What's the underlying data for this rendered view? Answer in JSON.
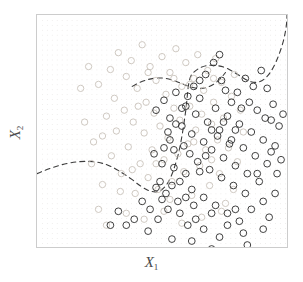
{
  "figure": {
    "xlabel": "X",
    "xlabel_sub": "1",
    "ylabel": "X",
    "ylabel_sub": "2"
  },
  "colors": {
    "class_orange": "#c9c2bb",
    "class_blue": "#2a2a2a",
    "boundary": "#3b3b3b",
    "lattice_dot": "#e3e0de",
    "frame": "#cccccc",
    "background": "#ffffff"
  },
  "chart_data": {
    "type": "scatter",
    "title": "",
    "xlabel": "X1",
    "ylabel": "X2",
    "xlim": [
      0,
      252
    ],
    "ylim": [
      0,
      234
    ],
    "grid": true,
    "grid_spacing": 5,
    "legend": "none",
    "annotations": [
      "dashed Bayes decision boundary"
    ],
    "series": [
      {
        "name": "class-orange",
        "marker": "open-circle",
        "color": "#c9c2bb",
        "radius": 3.2,
        "points": [
          [
            57,
            128
          ],
          [
            62,
            70
          ],
          [
            66,
            171
          ],
          [
            70,
            102
          ],
          [
            74,
            55
          ],
          [
            75,
            142
          ],
          [
            78,
            84
          ],
          [
            80,
            117
          ],
          [
            82,
            38
          ],
          [
            85,
            160
          ],
          [
            88,
            96
          ],
          [
            90,
            62
          ],
          [
            92,
            133
          ],
          [
            95,
            46
          ],
          [
            97,
            108
          ],
          [
            99,
            180
          ],
          [
            101,
            74
          ],
          [
            104,
            150
          ],
          [
            106,
            30
          ],
          [
            108,
            119
          ],
          [
            110,
            88
          ],
          [
            112,
            164
          ],
          [
            114,
            52
          ],
          [
            116,
            136
          ],
          [
            118,
            99
          ],
          [
            120,
            66
          ],
          [
            122,
            176
          ],
          [
            124,
            112
          ],
          [
            126,
            42
          ],
          [
            128,
            146
          ],
          [
            130,
            80
          ],
          [
            132,
            124
          ],
          [
            134,
            58
          ],
          [
            136,
            168
          ],
          [
            138,
            94
          ],
          [
            140,
            34
          ],
          [
            142,
            140
          ],
          [
            144,
            106
          ],
          [
            146,
            72
          ],
          [
            148,
            158
          ],
          [
            150,
            48
          ],
          [
            152,
            130
          ],
          [
            154,
            92
          ],
          [
            156,
            182
          ],
          [
            158,
            64
          ],
          [
            160,
            116
          ],
          [
            162,
            40
          ],
          [
            164,
            152
          ],
          [
            166,
            100
          ],
          [
            168,
            76
          ],
          [
            170,
            136
          ],
          [
            172,
            56
          ],
          [
            174,
            172
          ],
          [
            176,
            110
          ],
          [
            178,
            88
          ],
          [
            180,
            44
          ],
          [
            182,
            126
          ],
          [
            184,
            160
          ],
          [
            186,
            68
          ],
          [
            188,
            104
          ],
          [
            190,
            190
          ],
          [
            193,
            134
          ],
          [
            196,
            82
          ],
          [
            199,
            60
          ],
          [
            202,
            148
          ],
          [
            205,
            96
          ],
          [
            208,
            118
          ],
          [
            62,
            196
          ],
          [
            70,
            212
          ],
          [
            55,
            150
          ],
          [
            48,
            108
          ],
          [
            44,
            74
          ],
          [
            90,
            200
          ],
          [
            108,
            206
          ],
          [
            128,
            198
          ],
          [
            146,
            210
          ],
          [
            166,
            204
          ],
          [
            186,
            198
          ],
          [
            52,
            52
          ],
          [
            96,
            156
          ],
          [
            112,
            58
          ],
          [
            134,
            186
          ],
          [
            154,
            70
          ],
          [
            176,
            146
          ],
          [
            198,
            176
          ],
          [
            66,
            122
          ],
          [
            84,
            178
          ],
          [
            102,
            92
          ],
          [
            120,
            150
          ],
          [
            138,
            64
          ],
          [
            158,
            128
          ],
          [
            178,
            64
          ]
        ]
      },
      {
        "name": "class-blue",
        "marker": "open-circle",
        "color": "#2a2a2a",
        "radius": 3.4,
        "points": [
          [
            120,
            96
          ],
          [
            128,
            86
          ],
          [
            134,
            104
          ],
          [
            140,
            78
          ],
          [
            146,
            112
          ],
          [
            150,
            92
          ],
          [
            156,
            120
          ],
          [
            160,
            100
          ],
          [
            164,
            84
          ],
          [
            168,
            128
          ],
          [
            172,
            108
          ],
          [
            176,
            136
          ],
          [
            180,
            94
          ],
          [
            184,
            116
          ],
          [
            188,
            144
          ],
          [
            192,
            102
          ],
          [
            196,
            126
          ],
          [
            200,
            152
          ],
          [
            204,
            110
          ],
          [
            208,
            134
          ],
          [
            212,
            160
          ],
          [
            216,
            118
          ],
          [
            220,
            142
          ],
          [
            224,
            168
          ],
          [
            228,
            126
          ],
          [
            232,
            150
          ],
          [
            236,
            106
          ],
          [
            240,
            132
          ],
          [
            150,
            160
          ],
          [
            156,
            176
          ],
          [
            162,
            148
          ],
          [
            168,
            184
          ],
          [
            174,
            156
          ],
          [
            180,
            192
          ],
          [
            186,
            164
          ],
          [
            192,
            200
          ],
          [
            198,
            172
          ],
          [
            204,
            208
          ],
          [
            210,
            180
          ],
          [
            216,
            196
          ],
          [
            222,
            160
          ],
          [
            228,
            188
          ],
          [
            144,
            200
          ],
          [
            152,
            212
          ],
          [
            160,
            206
          ],
          [
            168,
            216
          ],
          [
            176,
            200
          ],
          [
            184,
            224
          ],
          [
            192,
            212
          ],
          [
            200,
            196
          ],
          [
            208,
            220
          ],
          [
            132,
            118
          ],
          [
            138,
            136
          ],
          [
            126,
            150
          ],
          [
            118,
            140
          ],
          [
            124,
            168
          ],
          [
            130,
            180
          ],
          [
            136,
            172
          ],
          [
            142,
            188
          ],
          [
            148,
            132
          ],
          [
            154,
            140
          ],
          [
            122,
            206
          ],
          [
            114,
            196
          ],
          [
            106,
            188
          ],
          [
            98,
            206
          ],
          [
            90,
            212
          ],
          [
            82,
            198
          ],
          [
            74,
            212
          ],
          [
            112,
            218
          ],
          [
            136,
            226
          ],
          [
            170,
            60
          ],
          [
            178,
            48
          ],
          [
            186,
            66
          ],
          [
            232,
            74
          ],
          [
            238,
            90
          ],
          [
            244,
            112
          ],
          [
            248,
            100
          ],
          [
            226,
            56
          ],
          [
            218,
            72
          ],
          [
            210,
            64
          ],
          [
            202,
            78
          ],
          [
            196,
            88
          ],
          [
            190,
            76
          ],
          [
            184,
            40
          ],
          [
            158,
            72
          ],
          [
            164,
            66
          ],
          [
            152,
            82
          ],
          [
            146,
            94
          ],
          [
            140,
            110
          ],
          [
            134,
            126
          ],
          [
            128,
            134
          ],
          [
            196,
            240
          ],
          [
            176,
            236
          ],
          [
            156,
            228
          ],
          [
            212,
            232
          ],
          [
            240,
            180
          ],
          [
            234,
            204
          ],
          [
            228,
            216
          ],
          [
            246,
            146
          ],
          [
            242,
            160
          ],
          [
            236,
            138
          ],
          [
            230,
            104
          ],
          [
            222,
            96
          ],
          [
            214,
            88
          ],
          [
            206,
            94
          ],
          [
            200,
            116
          ],
          [
            194,
            130
          ],
          [
            188,
            108
          ],
          [
            182,
            122
          ],
          [
            176,
            116
          ],
          [
            170,
            142
          ],
          [
            164,
            158
          ],
          [
            158,
            192
          ],
          [
            150,
            184
          ],
          [
            144,
            168
          ],
          [
            138,
            154
          ],
          [
            132,
            196
          ],
          [
            126,
            186
          ],
          [
            120,
            174
          ]
        ]
      }
    ],
    "boundary_paths": [
      "M 0 160 C 18 152, 38 146, 58 148 C 74 150, 84 158, 96 166 C 108 176, 118 182, 126 176 C 134 170, 138 156, 142 142 C 146 126, 148 110, 150 96 C 152 80, 152 66, 156 60 C 164 50, 178 48, 192 54 C 204 60, 212 68, 220 68 C 232 68, 240 52, 246 34 C 250 22, 252 10, 252 0",
      "M 96 72 C 106 66, 118 62, 130 64 C 142 66, 152 74, 164 74 C 176 74, 184 66, 190 58"
    ]
  }
}
